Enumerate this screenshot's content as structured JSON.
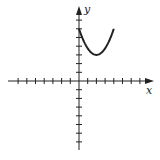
{
  "chart_data": {
    "type": "line",
    "title": "",
    "xlabel": "x",
    "ylabel": "y",
    "xlim": [
      -8,
      8
    ],
    "ylim": [
      -8,
      8
    ],
    "grid": false,
    "axis_ticks_unit": 1,
    "series": [
      {
        "name": "curve",
        "equation": "y = 0.75(x - 2)^2 + 3",
        "x": [
          0,
          0.5,
          1,
          1.5,
          2,
          2.5,
          3,
          3.5,
          4
        ],
        "y": [
          6,
          4.69,
          3.75,
          3.19,
          3,
          3.19,
          3.75,
          4.69,
          6
        ]
      }
    ]
  },
  "labels": {
    "x_axis": "x",
    "y_axis": "y"
  },
  "colors": {
    "axis": "#222222",
    "curve": "#222222"
  }
}
